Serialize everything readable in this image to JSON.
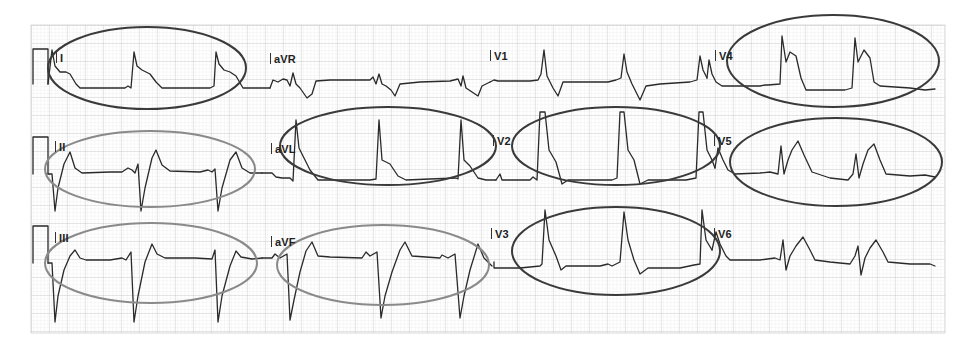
{
  "ecg": {
    "paper": {
      "background": "#ffffff",
      "grid_minor_color": "#e2e2e2",
      "grid_major_color": "#c8c8c8",
      "grid_bounds": {
        "x": 31,
        "y": 25,
        "width": 914,
        "height": 308
      }
    },
    "trace_color": "#2a2a2a",
    "leads": [
      {
        "name": "I",
        "row": 1,
        "col": 1
      },
      {
        "name": "aVR",
        "row": 1,
        "col": 2
      },
      {
        "name": "V1",
        "row": 1,
        "col": 3
      },
      {
        "name": "V4",
        "row": 1,
        "col": 4
      },
      {
        "name": "II",
        "row": 2,
        "col": 1
      },
      {
        "name": "aVL",
        "row": 2,
        "col": 2
      },
      {
        "name": "V2",
        "row": 2,
        "col": 3
      },
      {
        "name": "V5",
        "row": 2,
        "col": 4
      },
      {
        "name": "III",
        "row": 3,
        "col": 1
      },
      {
        "name": "aVF",
        "row": 3,
        "col": 2
      },
      {
        "name": "V3",
        "row": 3,
        "col": 3
      },
      {
        "name": "V6",
        "row": 3,
        "col": 4
      }
    ],
    "annotations": [
      {
        "lead": "I",
        "type": "ellipse",
        "color": "#3a3a3a",
        "meaning": "ST elevation"
      },
      {
        "lead": "aVL",
        "type": "ellipse",
        "color": "#3a3a3a",
        "meaning": "ST elevation"
      },
      {
        "lead": "V2",
        "type": "ellipse",
        "color": "#3a3a3a",
        "meaning": "ST elevation"
      },
      {
        "lead": "V3",
        "type": "ellipse",
        "color": "#3a3a3a",
        "meaning": "ST elevation"
      },
      {
        "lead": "V4",
        "type": "ellipse",
        "color": "#3a3a3a",
        "meaning": "ST elevation"
      },
      {
        "lead": "V5",
        "type": "ellipse",
        "color": "#3a3a3a",
        "meaning": "ST elevation"
      },
      {
        "lead": "II",
        "type": "ellipse",
        "color": "#8a8a8a",
        "meaning": "reciprocal change"
      },
      {
        "lead": "III",
        "type": "ellipse",
        "color": "#8a8a8a",
        "meaning": "reciprocal change"
      },
      {
        "lead": "aVF",
        "type": "ellipse",
        "color": "#8a8a8a",
        "meaning": "reciprocal change"
      }
    ]
  }
}
